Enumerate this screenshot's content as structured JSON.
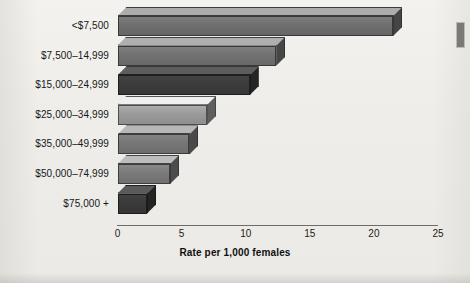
{
  "figure": {
    "background_color": "#efeeea",
    "axis_color": "#6e6c68",
    "edge_mark_name": "page-edge-artifact"
  },
  "chart_data": {
    "type": "bar",
    "orientation": "horizontal",
    "title": "",
    "subtitle": "",
    "xlabel": "Rate per 1,000 females",
    "ylabel": "",
    "categories": [
      "<$7,500",
      "$7,500–14,999",
      "$15,000–24,999",
      "$25,000–34,999",
      "$35,000–49,999",
      "$50,000–74,999",
      "$75,000 +"
    ],
    "values": [
      21.5,
      12.4,
      10.3,
      7.0,
      5.6,
      4.1,
      2.3
    ],
    "bar_colors": [
      "#6f6f6f",
      "#717171",
      "#3c3c3c",
      "#9a9a9a",
      "#767676",
      "#7a7a7a",
      "#3a3a3a"
    ],
    "xlim": [
      0,
      25
    ],
    "xticks": [
      0,
      5,
      10,
      15,
      20,
      25
    ],
    "xtick_labels": [
      "0",
      "5",
      "10",
      "15",
      "20",
      "25"
    ],
    "grid": false,
    "legend": false,
    "legend_position": "none",
    "style": "3d-shaded-bars"
  }
}
